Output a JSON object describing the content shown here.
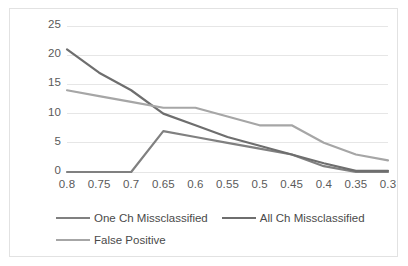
{
  "chart_data": {
    "type": "line",
    "title": "",
    "xlabel": "",
    "ylabel": "",
    "x": [
      0.8,
      0.75,
      0.7,
      0.65,
      0.6,
      0.55,
      0.5,
      0.45,
      0.4,
      0.35,
      0.3
    ],
    "x_tick_labels": [
      "0.8",
      "0.75",
      "0.7",
      "0.65",
      "0.6",
      "0.55",
      "0.5",
      "0.45",
      "0.4",
      "0.35",
      "0.3"
    ],
    "y_tick_labels": [
      "0",
      "5",
      "10",
      "15",
      "20",
      "25"
    ],
    "y_ticks": [
      0,
      5,
      10,
      15,
      20,
      25
    ],
    "ylim": [
      0,
      25
    ],
    "grid": "horizontal",
    "legend_position": "bottom",
    "series": [
      {
        "name": "One Ch Missclassified",
        "color": "#808080",
        "values": [
          0,
          0,
          0,
          7,
          6,
          5,
          4,
          3,
          1,
          0,
          0
        ]
      },
      {
        "name": "All Ch Missclassified",
        "color": "#6e6e6e",
        "values": [
          21,
          17,
          14,
          10,
          8,
          6,
          4.5,
          3,
          1.5,
          0.2,
          0.2
        ]
      },
      {
        "name": "False Positive",
        "color": "#a6a6a6",
        "values": [
          14,
          13,
          12,
          11,
          11,
          9.5,
          8,
          8,
          5,
          3,
          2
        ]
      }
    ]
  },
  "legend": {
    "rows": [
      [
        "One Ch Missclassified",
        "All Ch Missclassified"
      ],
      [
        "False Positive"
      ]
    ]
  },
  "colors": {
    "gridline": "#e6e6e6",
    "axis_text": "#5a5a5a",
    "frame_border": "#e2e2e2",
    "background": "#ffffff"
  }
}
